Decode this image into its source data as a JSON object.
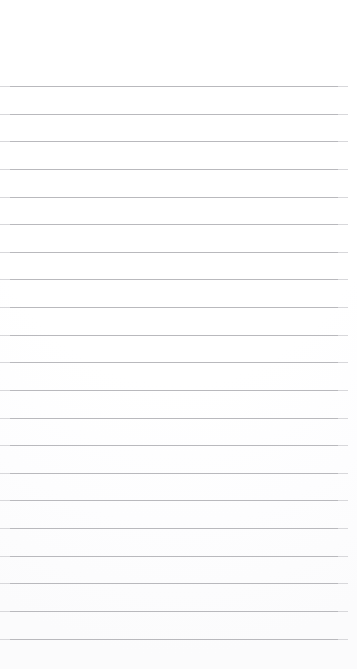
{
  "document": {
    "kind": "lined-paper",
    "title": "Lined Paper Sheet",
    "has_text_content": false,
    "page_width": 357,
    "page_height": 669,
    "background_color": "#ffffff"
  },
  "ruling": {
    "line_color": "#b9b9bd",
    "line_thickness": 1,
    "line_count": 21,
    "first_line_y": 86,
    "line_spacing": 27.65,
    "line_start_x": 0,
    "line_end_x": 348,
    "line_length": 348
  },
  "margins": {
    "top_margin_height": 86,
    "bottom_margin_height": 30,
    "right_margin_width": 9,
    "left_margin_width": 0
  },
  "lines": [
    {
      "index": 1,
      "y": 86,
      "content": ""
    },
    {
      "index": 2,
      "y": 114,
      "content": ""
    },
    {
      "index": 3,
      "y": 141,
      "content": ""
    },
    {
      "index": 4,
      "y": 169,
      "content": ""
    },
    {
      "index": 5,
      "y": 197,
      "content": ""
    },
    {
      "index": 6,
      "y": 224,
      "content": ""
    },
    {
      "index": 7,
      "y": 252,
      "content": ""
    },
    {
      "index": 8,
      "y": 279,
      "content": ""
    },
    {
      "index": 9,
      "y": 307,
      "content": ""
    },
    {
      "index": 10,
      "y": 335,
      "content": ""
    },
    {
      "index": 11,
      "y": 362,
      "content": ""
    },
    {
      "index": 12,
      "y": 390,
      "content": ""
    },
    {
      "index": 13,
      "y": 418,
      "content": ""
    },
    {
      "index": 14,
      "y": 445,
      "content": ""
    },
    {
      "index": 15,
      "y": 473,
      "content": ""
    },
    {
      "index": 16,
      "y": 500,
      "content": ""
    },
    {
      "index": 17,
      "y": 528,
      "content": ""
    },
    {
      "index": 18,
      "y": 556,
      "content": ""
    },
    {
      "index": 19,
      "y": 583,
      "content": ""
    },
    {
      "index": 20,
      "y": 611,
      "content": ""
    },
    {
      "index": 21,
      "y": 639,
      "content": ""
    }
  ]
}
